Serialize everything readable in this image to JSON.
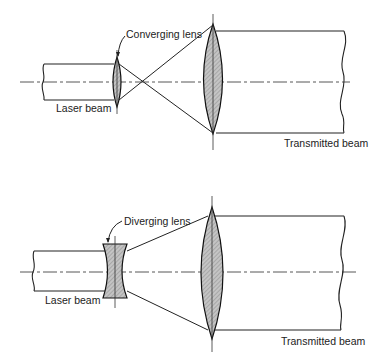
{
  "diagrams": [
    {
      "id": "converging",
      "lens1_label": "Converging lens",
      "input_label": "Laser beam",
      "output_label": "Transmitted beam"
    },
    {
      "id": "diverging",
      "lens1_label": "Diverging lens",
      "input_label": "Laser beam",
      "output_label": "Transmitted beam"
    }
  ],
  "colors": {
    "line": "#222222",
    "lens_fill": "#b8b8b8",
    "background": "#ffffff"
  }
}
